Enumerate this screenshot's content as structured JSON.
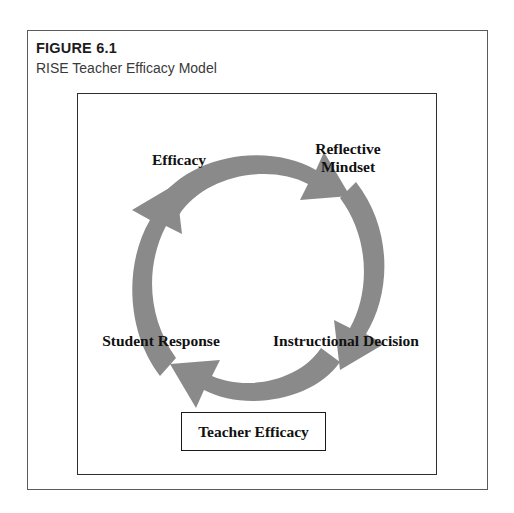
{
  "figure": {
    "number_label": "FIGURE 6.1",
    "title": "RISE Teacher Efficacy Model"
  },
  "diagram": {
    "type": "cycle",
    "direction": "clockwise",
    "arrow_color": "#8a8a8a",
    "nodes": [
      {
        "id": "efficacy",
        "label": "Efficacy",
        "position": "top-left"
      },
      {
        "id": "reflective-mindset",
        "label": "Reflective\nMindset",
        "line1": "Reflective",
        "line2": "Mindset",
        "position": "top-right"
      },
      {
        "id": "instructional-decision",
        "label": "Instructional Decision",
        "position": "bottom-right"
      },
      {
        "id": "student-response",
        "label": "Student Response",
        "position": "bottom-left"
      }
    ],
    "arrows": [
      {
        "id": "arrow-top",
        "from": "efficacy",
        "to": "reflective-mindset"
      },
      {
        "id": "arrow-right",
        "from": "reflective-mindset",
        "to": "instructional-decision"
      },
      {
        "id": "arrow-bottom",
        "from": "instructional-decision",
        "to": "student-response"
      },
      {
        "id": "arrow-left",
        "from": "student-response",
        "to": "efficacy"
      }
    ],
    "center_box": {
      "label": "Teacher Efficacy"
    }
  }
}
